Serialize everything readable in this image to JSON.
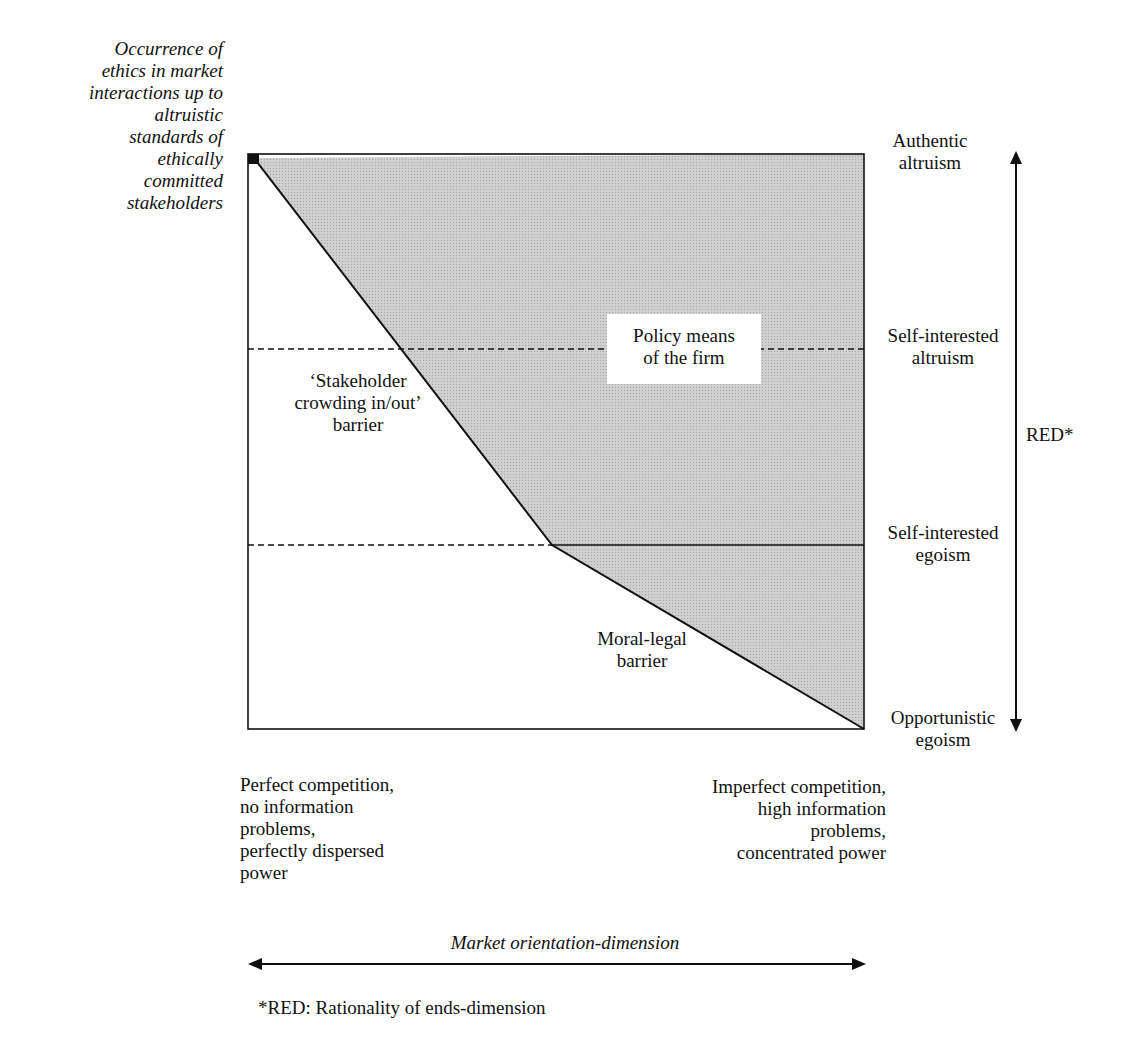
{
  "y_axis_label": "Occurrence of\nethics in market\ninteractions up to\naltruistic\nstandards of\nethically\ncommitted\nstakeholders",
  "levels": [
    {
      "label": "Authentic\naltruism"
    },
    {
      "label": "Self-interested\naltruism"
    },
    {
      "label": "Self-interested\negoism"
    },
    {
      "label": "Opportunistic\negoism"
    }
  ],
  "regions": {
    "policy": "Policy means\nof the firm",
    "stakeholder_barrier": "‘Stakeholder\ncrowding in/out’\nbarrier",
    "moral_legal_barrier": "Moral-legal\nbarrier"
  },
  "red_axis_label": "RED*",
  "x_extremes": {
    "left": "Perfect competition,\nno information\nproblems,\nperfectly dispersed\npower",
    "right": "Imperfect competition,\nhigh information\nproblems,\nconcentrated power"
  },
  "x_axis_label": "Market orientation-dimension",
  "footnote": "*RED: Rationality of ends-dimension",
  "colors": {
    "shaded_area": "#c9c9c9",
    "line": "#111111",
    "background": "#ffffff"
  }
}
